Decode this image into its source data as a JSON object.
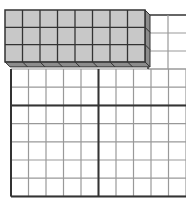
{
  "figure": {
    "block": {
      "rows": 3,
      "cols": 8,
      "count": 24,
      "face_color": "#c8c8c8",
      "side_color": "#8c8c8c",
      "line_color": "#333333"
    },
    "grid": {
      "visible_rows": 7,
      "visible_cols": 10,
      "thick_divider_col": 5,
      "thick_divider_row": 2,
      "line_color": "#999999",
      "border_color": "#333333"
    }
  }
}
